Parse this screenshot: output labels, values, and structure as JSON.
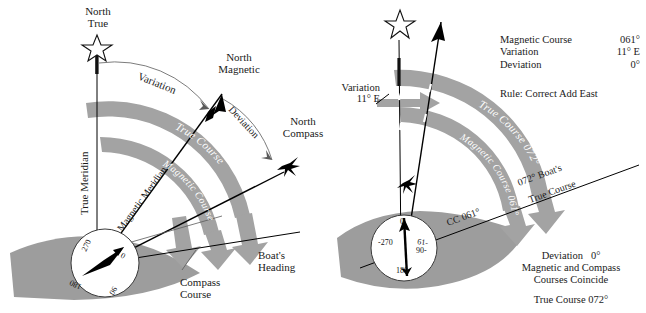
{
  "figure": {
    "colors": {
      "band_grey": "#a3a3a3",
      "hull_grey": "#9d9d9d",
      "line_black": "#000000",
      "thin_grey": "#5a5a5a",
      "background": "#ffffff"
    }
  },
  "left_panel": {
    "name": "Uncorrected compass diagram",
    "north_true": "North\nTrue",
    "north_magnetic": "North\nMagnetic",
    "north_compass": "North\nCompass",
    "variation_arc_label": "Variation",
    "deviation_arc_label": "Deviation",
    "true_meridian": "True Meridian",
    "magnetic_meridian": "Magnetic Meridian",
    "band_true_course": "True Course",
    "band_magnetic_course": "Magnetic Course",
    "boats_heading": "Boat's\nHeading",
    "compass_course": "Compass\nCourse",
    "rose_marks": [
      "270",
      "0",
      "90",
      "180"
    ]
  },
  "right_panel": {
    "name": "Worked example, variation 11 degrees East",
    "variation_callout": "Variation\n11° E",
    "band_true_course": "True Course 072°",
    "band_magnetic_course": "Magnetic Course 061°",
    "compass_course_label": "CC 061°",
    "boats_true_course": "072° Boat's\nTrue Course",
    "rose_marks": [
      "270",
      "0",
      "61",
      "90",
      "180"
    ],
    "data_table": [
      {
        "label": "Magnetic Course",
        "value": "061°"
      },
      {
        "label": "Variation",
        "value": "11° E"
      },
      {
        "label": "Deviation",
        "value": "0°"
      }
    ],
    "rule": "Rule: Correct Add East",
    "notes": [
      "Deviation   0°",
      "Magnetic and Compass",
      "Courses Coincide"
    ],
    "true_course_note": "True Course 072°"
  }
}
